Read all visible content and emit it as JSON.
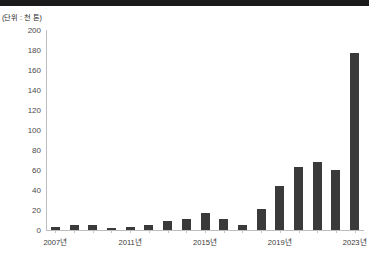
{
  "header": {
    "top_rule_color": "#1a1a1a"
  },
  "chart_data": {
    "type": "bar",
    "title": "",
    "subtitle": "",
    "unit_label": "(단위 : 천 톤)",
    "xlabel": "",
    "ylabel": "",
    "ylim": [
      0,
      200
    ],
    "ytick_step": 20,
    "grid": false,
    "legend": "none",
    "bar_color": "#3a3a3a",
    "axis_color": "#bdbdbd",
    "categories": [
      "2007년",
      "2008년",
      "2009년",
      "2010년",
      "2011년",
      "2012년",
      "2013년",
      "2014년",
      "2015년",
      "2016년",
      "2017년",
      "2018년",
      "2019년",
      "2020년",
      "2021년",
      "2022년",
      "2023년"
    ],
    "values": [
      3,
      5,
      5,
      2,
      3,
      5,
      9,
      11,
      17,
      11,
      5,
      21,
      44,
      63,
      68,
      60,
      177
    ],
    "yticks": [
      "0",
      "20",
      "40",
      "60",
      "80",
      "100",
      "120",
      "140",
      "160",
      "180",
      "200"
    ],
    "ytick_values": [
      0,
      20,
      40,
      60,
      80,
      100,
      120,
      140,
      160,
      180,
      200
    ],
    "visible_xtick_labels": [
      "2007년",
      "2011년",
      "2015년",
      "2019년",
      "2023년"
    ],
    "visible_xtick_indices": [
      0,
      4,
      8,
      12,
      16
    ]
  }
}
